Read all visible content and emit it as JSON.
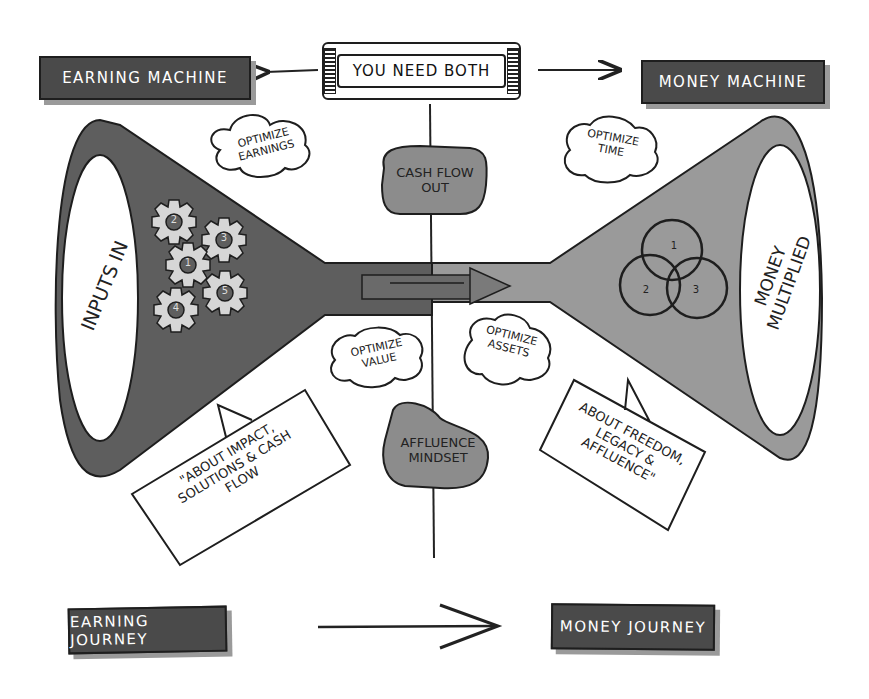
{
  "header": {
    "center_banner": "You need both",
    "left_title": "Earning Machine",
    "right_title": "Money Machine"
  },
  "left_funnel": {
    "mouth_label": "Inputs in",
    "gears": [
      "1",
      "2",
      "3",
      "4",
      "5"
    ],
    "callout": "\"About impact, solutions & cash flow",
    "fill_color": "#5e5e5e"
  },
  "right_funnel": {
    "mouth_label": "Money multiplied",
    "circles": [
      "1",
      "2",
      "3"
    ],
    "callout": "About freedom, legacy & affluence\"",
    "fill_color": "#9a9a9a"
  },
  "center": {
    "top_bubble": "Cash flow out",
    "bottom_bubble": "Affluence mindset"
  },
  "clouds": [
    {
      "id": "optimize-earnings",
      "line1": "Optimize",
      "line2": "Earnings"
    },
    {
      "id": "optimize-time",
      "line1": "Optimize",
      "line2": "Time"
    },
    {
      "id": "optimize-value",
      "line1": "Optimize",
      "line2": "Value"
    },
    {
      "id": "optimize-assets",
      "line1": "Optimize",
      "line2": "Assets"
    }
  ],
  "footer": {
    "left_label": "Earning Journey",
    "right_label": "Money Journey"
  },
  "colors": {
    "dark_label": "#4a4a4a",
    "outline": "#1e1e1e",
    "light_fill": "#d6d6d6",
    "mid_fill": "#8c8c8c"
  }
}
